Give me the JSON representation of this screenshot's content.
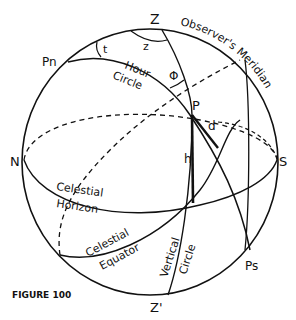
{
  "figure": {
    "caption": "FIGURE 100",
    "stroke_color": "#111111",
    "background": "#ffffff"
  },
  "points": {
    "zenith": "Z",
    "nadir": "Z'",
    "north_pole": "Pn",
    "south_pole": "Ps",
    "north": "N",
    "south": "S",
    "body": "P"
  },
  "angles": {
    "meridian_angle": "t",
    "azimuth_angle": "z",
    "parallactic_angle": "Φ",
    "altitude": "h",
    "declination": "d"
  },
  "circles": {
    "observers_meridian": "Observer's Meridian",
    "hour_circle_1": "Hour",
    "hour_circle_2": "Circle",
    "horizon_1": "Celestial",
    "horizon_2": "Horizon",
    "equator_1": "Celestial",
    "equator_2": "Equator",
    "vertical_1": "Vertical",
    "vertical_2": "Circle"
  }
}
